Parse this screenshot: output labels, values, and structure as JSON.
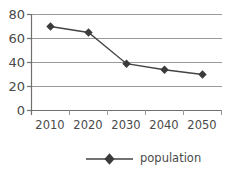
{
  "chart_data": {
    "type": "line",
    "title": "",
    "xlabel": "",
    "ylabel": "",
    "categories": [
      "2010",
      "2020",
      "2030",
      "2040",
      "2050"
    ],
    "series": [
      {
        "name": "population",
        "values": [
          70,
          65,
          39,
          34,
          30
        ]
      }
    ],
    "ylim": [
      0,
      80
    ],
    "yticks": [
      "0",
      "20",
      "40",
      "60",
      "80"
    ],
    "ytick_values": [
      0,
      20,
      40,
      60,
      80
    ],
    "grid": "horizontal",
    "legend_position": "bottom",
    "marker": "diamond",
    "line_color": "#444444",
    "marker_color": "#3b3b3b",
    "grid_color": "#9a9a9a",
    "axis_color": "#777777",
    "background_color": "#ffffff"
  },
  "legend": {
    "entries": [
      {
        "label": "population",
        "marker": "diamond-marker"
      }
    ]
  }
}
